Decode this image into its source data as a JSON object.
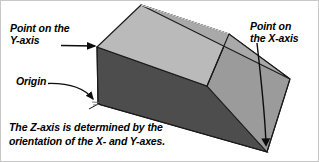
{
  "figure": {
    "kind": "3d-axis-orientation-diagram",
    "background_color": "#ffffff",
    "border_color": "#c8c8c8",
    "labels": {
      "y_axis_label": "Point on the\nY-axis",
      "origin_label": "Origin",
      "x_axis_label": "Point on\nthe X-axis",
      "caption": "The Z-axis is determined by the\norientation of the X- and Y-axes."
    },
    "solid": {
      "description": "Shaded 3D wedge/prism solid with flat top, vertical front-left face and sloping ramp face descending to the right",
      "colors": {
        "top_face": "#b9b9b9",
        "top_roof_face": "#aeaeae",
        "front_face": "#4d4d4d",
        "ramp_face": "#9b9b9b",
        "right_face": "#8f8f8f",
        "outline": "#1a1a1a"
      },
      "vertices": {
        "top_apex": "140,4",
        "top_left": "96,46",
        "ridge_right": "228,33",
        "right_vertex": "289,78",
        "bottom_origin": "97,103",
        "bottom_right": "266,151"
      }
    },
    "annotations": {
      "y_axis_arrow": {
        "type": "straight-arrow",
        "from": "62,44",
        "to": "95,45",
        "points_to": "top_left"
      },
      "origin_arrow": {
        "type": "curved-arrow",
        "from": "48,83",
        "to": "94,100",
        "points_to": "bottom_origin"
      },
      "x_axis_arrow": {
        "type": "straight-arrow-down",
        "from": "258,42",
        "to": "266,148",
        "points_to": "bottom_right"
      },
      "z_axis_tick": {
        "type": "small-axis-mark",
        "at": "97,103"
      }
    }
  }
}
